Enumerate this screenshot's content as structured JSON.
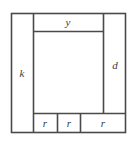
{
  "figure": {
    "background_color": "#ffffff",
    "stroke_color": "#4a4a4a",
    "fill_color": "#ffffff",
    "labels": {
      "top_bar": "y",
      "left_column": "k",
      "right_column": "d",
      "bottom_cell_1": "r",
      "bottom_cell_2": "r",
      "bottom_cell_3": "r"
    },
    "geometry": {
      "outer": {
        "x": 11,
        "y": 13,
        "width": 115,
        "height": 120
      },
      "left_column_divider_x": 33,
      "right_column_divider_x": 103,
      "top_bar_bottom_y": 31,
      "bottom_row_top_y": 113,
      "bottom_divider_1_x": 57,
      "bottom_divider_2_x": 80
    }
  }
}
